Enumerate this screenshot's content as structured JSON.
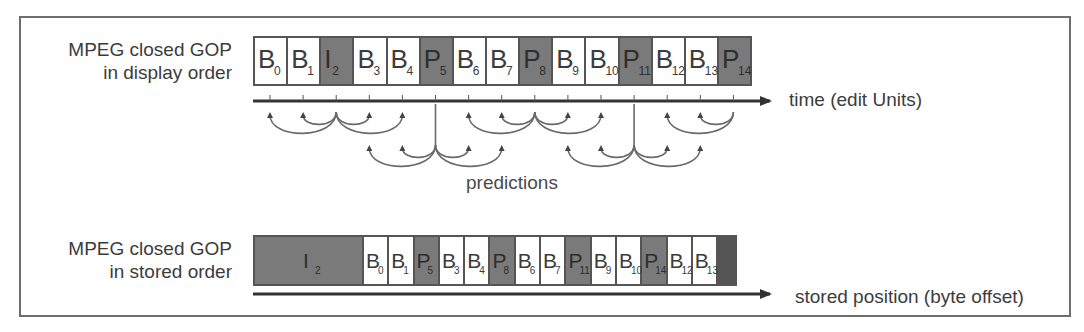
{
  "display_row": {
    "label_line1": "MPEG closed GOP",
    "label_line2": "in display order",
    "axis_label": "time (edit Units)",
    "frames": [
      {
        "type": "B",
        "index": "0",
        "dark": false
      },
      {
        "type": "B",
        "index": "1",
        "dark": false
      },
      {
        "type": "I",
        "index": "2",
        "dark": true
      },
      {
        "type": "B",
        "index": "3",
        "dark": false
      },
      {
        "type": "B",
        "index": "4",
        "dark": false
      },
      {
        "type": "P",
        "index": "5",
        "dark": true
      },
      {
        "type": "B",
        "index": "6",
        "dark": false
      },
      {
        "type": "B",
        "index": "7",
        "dark": false
      },
      {
        "type": "P",
        "index": "8",
        "dark": true
      },
      {
        "type": "B",
        "index": "9",
        "dark": false
      },
      {
        "type": "B",
        "index": "10",
        "dark": false
      },
      {
        "type": "P",
        "index": "11",
        "dark": true
      },
      {
        "type": "B",
        "index": "12",
        "dark": false
      },
      {
        "type": "B",
        "index": "13",
        "dark": false
      },
      {
        "type": "P",
        "index": "14",
        "dark": true
      }
    ]
  },
  "predictions_label": "predictions",
  "stored_row": {
    "label_line1": "MPEG closed GOP",
    "label_line2": "in stored order",
    "axis_label": "stored position (byte offset)",
    "frames": [
      {
        "type": "I",
        "index": "2",
        "dark": true
      },
      {
        "type": "B",
        "index": "0",
        "dark": false
      },
      {
        "type": "B",
        "index": "1",
        "dark": false
      },
      {
        "type": "P",
        "index": "5",
        "dark": true
      },
      {
        "type": "B",
        "index": "3",
        "dark": false
      },
      {
        "type": "B",
        "index": "4",
        "dark": false
      },
      {
        "type": "P",
        "index": "8",
        "dark": true
      },
      {
        "type": "B",
        "index": "6",
        "dark": false
      },
      {
        "type": "B",
        "index": "7",
        "dark": false
      },
      {
        "type": "P",
        "index": "11",
        "dark": true
      },
      {
        "type": "B",
        "index": "9",
        "dark": false
      },
      {
        "type": "B",
        "index": "10",
        "dark": false
      },
      {
        "type": "P",
        "index": "14",
        "dark": true
      },
      {
        "type": "B",
        "index": "12",
        "dark": false
      },
      {
        "type": "B",
        "index": "13",
        "dark": false
      }
    ]
  },
  "colors": {
    "dark_frame": "#7a7a7a",
    "light_frame": "#ffffff",
    "line": "#555555",
    "arc": "#6a6a6a"
  }
}
